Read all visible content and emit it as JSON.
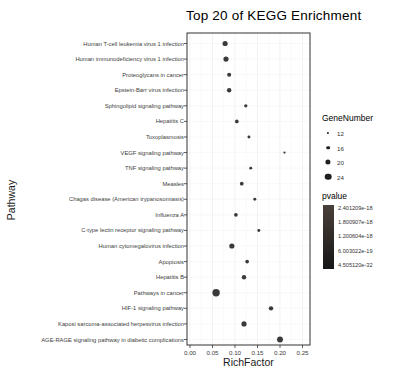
{
  "title": "Top 20 of KEGG Enrichment",
  "colors": {
    "dot": "#3a3a3a",
    "legend_dot": "#1f1f1f",
    "panel_border": "#333333",
    "grid_major": "#ececec",
    "grid_minor": "#f5f5f5",
    "grid_row": "#f3f3f3",
    "tick": "#333333",
    "text": "#404040",
    "pvalue_bar_top": "#4a403a",
    "pvalue_bar_bottom": "#161616"
  },
  "chart_data": {
    "type": "scatter",
    "title": "Top 20 of KEGG Enrichment",
    "xlabel": "RichFactor",
    "ylabel": "Pathway",
    "xlim": [
      0,
      0.27
    ],
    "x_tick_labels": [
      "0.00",
      "0.05",
      "0.10",
      "0.15",
      "0.20",
      "0.25"
    ],
    "x_tick_values": [
      0,
      0.05,
      0.1,
      0.15,
      0.2,
      0.25
    ],
    "grid": "on",
    "legend_position": "right",
    "points": [
      {
        "pathway": "Human T-cell leukemia virus 1 infection",
        "rich_factor": 0.078,
        "gene_number": 20
      },
      {
        "pathway": "Human immunodeficiency virus 1 infection",
        "rich_factor": 0.08,
        "gene_number": 20
      },
      {
        "pathway": "Proteoglycans in cancer",
        "rich_factor": 0.087,
        "gene_number": 17
      },
      {
        "pathway": "Epstein-Barr virus infection",
        "rich_factor": 0.087,
        "gene_number": 18
      },
      {
        "pathway": "Sphingolipid signaling pathway",
        "rich_factor": 0.124,
        "gene_number": 15
      },
      {
        "pathway": "Hepatitis C",
        "rich_factor": 0.104,
        "gene_number": 16
      },
      {
        "pathway": "Toxoplasmosis",
        "rich_factor": 0.131,
        "gene_number": 14
      },
      {
        "pathway": "VEGF signaling pathway",
        "rich_factor": 0.21,
        "gene_number": 12
      },
      {
        "pathway": "TNF signaling pathway",
        "rich_factor": 0.135,
        "gene_number": 14
      },
      {
        "pathway": "Measles",
        "rich_factor": 0.115,
        "gene_number": 16
      },
      {
        "pathway": "Chagas disease (American trypanosomiasis)",
        "rich_factor": 0.144,
        "gene_number": 14
      },
      {
        "pathway": "Influenza A",
        "rich_factor": 0.102,
        "gene_number": 16
      },
      {
        "pathway": "C-type lectin receptor signaling pathway",
        "rich_factor": 0.153,
        "gene_number": 14
      },
      {
        "pathway": "Human cytomegalovirus infection",
        "rich_factor": 0.093,
        "gene_number": 20
      },
      {
        "pathway": "Apoptosis",
        "rich_factor": 0.127,
        "gene_number": 16
      },
      {
        "pathway": "Hepatitis B",
        "rich_factor": 0.12,
        "gene_number": 18
      },
      {
        "pathway": "Pathways in cancer",
        "rich_factor": 0.058,
        "gene_number": 26
      },
      {
        "pathway": "HIF-1 signaling pathway",
        "rich_factor": 0.18,
        "gene_number": 18
      },
      {
        "pathway": "Kaposi sarcoma-associated herpesvirus infection",
        "rich_factor": 0.12,
        "gene_number": 20
      },
      {
        "pathway": "AGE-RAGE signaling pathway in diabetic complications",
        "rich_factor": 0.2,
        "gene_number": 22
      }
    ],
    "legend_gene_number": {
      "title": "GeneNumber",
      "sizes": [
        12,
        16,
        20,
        24
      ]
    },
    "legend_pvalue": {
      "title": "pvalue",
      "labels": [
        "2.401209e-18",
        "1.800907e-18",
        "1.200604e-18",
        "6.003022e-19",
        "4.505120e-32"
      ]
    }
  }
}
